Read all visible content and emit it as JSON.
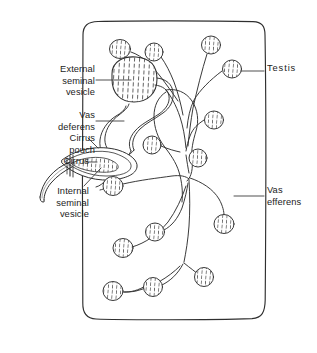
{
  "figure": {
    "background_color": "#ffffff",
    "ink_color": "#2b2b2b",
    "text_color": "#1c1c1c",
    "width": 317,
    "height": 353
  },
  "labels": {
    "external_seminal_vesicle": "External\nseminal\nvesicle",
    "vas_deferens": "Vas\ndeferens",
    "cirrus_pouch": "Cirrus\npouch",
    "cirrus": "Cirrus",
    "internal_seminal_vesicle": "Internal\nseminal\nvesicle",
    "testis": "Testis",
    "vas_efferens": "Vas\nefferens"
  },
  "structures": {
    "body_wall": "proglottid-body-outline",
    "external_seminal_vesicle": "stippled-oval-organ",
    "internal_seminal_vesicle": "stippled-elongate-organ",
    "cirrus_pouch": "elongate-sac",
    "cirrus": "protruding-tube",
    "vas_deferens": "coiled-duct",
    "vas_efferens_network": "branching-duct-tree",
    "testis_count": 16
  },
  "testes": [
    {
      "id": "testis-1",
      "cx": 120,
      "cy": 49,
      "rx": 10.5,
      "ry": 9.5
    },
    {
      "id": "testis-2",
      "cx": 154,
      "cy": 52,
      "rx": 9.0,
      "ry": 9.0
    },
    {
      "id": "testis-3",
      "cx": 211,
      "cy": 45,
      "rx": 9.5,
      "ry": 9.0
    },
    {
      "id": "testis-4",
      "cx": 232,
      "cy": 69,
      "rx": 9.5,
      "ry": 9.0
    },
    {
      "id": "testis-5",
      "cx": 214,
      "cy": 120,
      "rx": 9.5,
      "ry": 9.0
    },
    {
      "id": "testis-6",
      "cx": 152,
      "cy": 145,
      "rx": 9.0,
      "ry": 9.0
    },
    {
      "id": "testis-7",
      "cx": 198,
      "cy": 158,
      "rx": 9.0,
      "ry": 9.0
    },
    {
      "id": "testis-8",
      "cx": 113,
      "cy": 186,
      "rx": 10.0,
      "ry": 9.5
    },
    {
      "id": "testis-9",
      "cx": 224,
      "cy": 224,
      "rx": 10.0,
      "ry": 9.5
    },
    {
      "id": "testis-10",
      "cx": 155,
      "cy": 232,
      "rx": 9.5,
      "ry": 9.0
    },
    {
      "id": "testis-11",
      "cx": 123,
      "cy": 248,
      "rx": 10.0,
      "ry": 9.5
    },
    {
      "id": "testis-12",
      "cx": 204,
      "cy": 277,
      "rx": 9.5,
      "ry": 9.5
    },
    {
      "id": "testis-13",
      "cx": 153,
      "cy": 287,
      "rx": 9.5,
      "ry": 9.5
    },
    {
      "id": "testis-14",
      "cx": 113,
      "cy": 291,
      "rx": 10.0,
      "ry": 9.5
    }
  ]
}
